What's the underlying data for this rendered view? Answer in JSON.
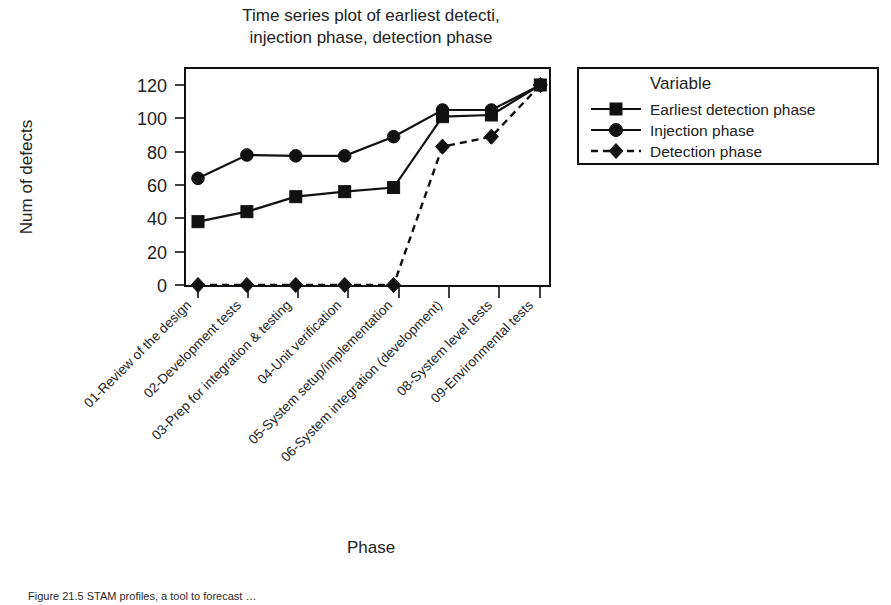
{
  "chart_data": {
    "type": "line",
    "title": "Time series plot of earliest detecti,\ninjection phase, detection phase",
    "title_line1": "Time series plot of earliest detecti,",
    "title_line2": "injection phase, detection phase",
    "xlabel": "Phase",
    "ylabel": "Num of defects",
    "ylim": [
      0,
      130
    ],
    "yticks": [
      0,
      20,
      40,
      60,
      80,
      100,
      120
    ],
    "ytick_labels": [
      "0",
      "20",
      "40",
      "60",
      "80",
      "100",
      "120"
    ],
    "grid": false,
    "legend_position": "right-outside",
    "legend_title": "Variable",
    "categories": [
      "01-Review of the design",
      "02-Development tests",
      "03-Prep for integration & testing",
      "04-Unit verification",
      "05-System setup/implementation",
      "06-System integration (development)",
      "08-System level tests",
      "09-Environmental tests"
    ],
    "series": [
      {
        "name": "Earliest detection phase",
        "marker": "square",
        "linestyle": "solid",
        "color": "#111111",
        "values": [
          38,
          44,
          53,
          56,
          58.5,
          101,
          102,
          120
        ]
      },
      {
        "name": "Injection phase",
        "marker": "circle",
        "linestyle": "solid",
        "color": "#111111",
        "values": [
          64,
          78,
          77.5,
          77.5,
          89,
          105,
          105,
          120
        ]
      },
      {
        "name": "Detection phase",
        "marker": "diamond",
        "linestyle": "dashed",
        "color": "#111111",
        "values": [
          0,
          0,
          0,
          0,
          0,
          83,
          89,
          120
        ]
      }
    ]
  },
  "caption": {
    "text": "Figure 21.5 STAM profiles, a tool to forecast …"
  }
}
